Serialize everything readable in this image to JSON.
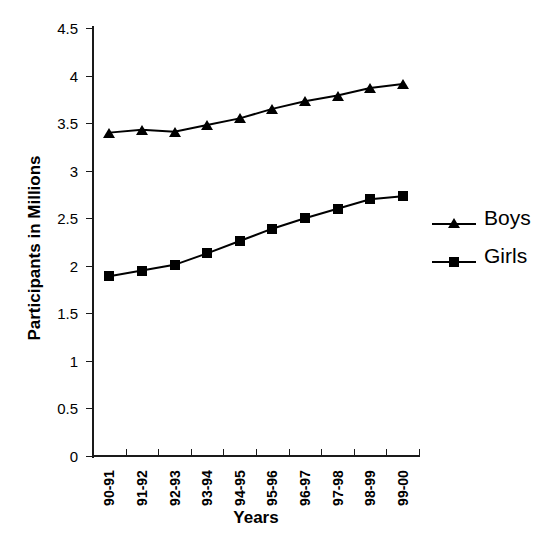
{
  "chart_data": {
    "type": "line",
    "title": "",
    "xlabel": "Years",
    "ylabel": "Participants in Millions",
    "categories": [
      "90-91",
      "91-92",
      "92-93",
      "93-94",
      "94-95",
      "95-96",
      "96-97",
      "97-98",
      "98-99",
      "99-00"
    ],
    "ylim": [
      0,
      4.5
    ],
    "yticks": [
      "0",
      "0.5",
      "1",
      "1.5",
      "2",
      "2.5",
      "3",
      "3.5",
      "4",
      "4.5"
    ],
    "ytick_values": [
      0,
      0.5,
      1,
      1.5,
      2,
      2.5,
      3,
      3.5,
      4,
      4.5
    ],
    "grid": false,
    "legend_position": "right",
    "series": [
      {
        "name": "Boys",
        "marker": "triangle",
        "color": "#000000",
        "values": [
          3.4,
          3.43,
          3.41,
          3.48,
          3.55,
          3.65,
          3.73,
          3.79,
          3.87,
          3.91
        ]
      },
      {
        "name": "Girls",
        "marker": "square",
        "color": "#000000",
        "values": [
          1.89,
          1.95,
          2.01,
          2.13,
          2.26,
          2.39,
          2.5,
          2.6,
          2.7,
          2.73
        ]
      }
    ]
  }
}
